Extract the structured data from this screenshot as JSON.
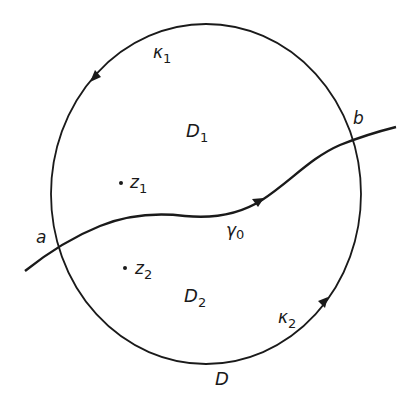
{
  "diagram": {
    "type": "complex-analysis-domain",
    "colors": {
      "ink": "#1a1a1a",
      "background": "#ffffff"
    },
    "region": {
      "label": "D"
    },
    "subregions": [
      {
        "label": "D",
        "subscript": "1"
      },
      {
        "label": "D",
        "subscript": "2"
      }
    ],
    "arcs": [
      {
        "label": "κ",
        "subscript": "1",
        "direction": "counterclockwise (upper arc, arrow pointing down-left)"
      },
      {
        "label": "κ",
        "subscript": "2",
        "direction": "counterclockwise (lower arc, arrow pointing up-right)"
      }
    ],
    "curve": {
      "label": "γ",
      "subscript": "0",
      "direction": "from a to b"
    },
    "points": [
      {
        "label": "a"
      },
      {
        "label": "b"
      },
      {
        "label": "z",
        "subscript": "1"
      },
      {
        "label": "z",
        "subscript": "2"
      }
    ]
  }
}
